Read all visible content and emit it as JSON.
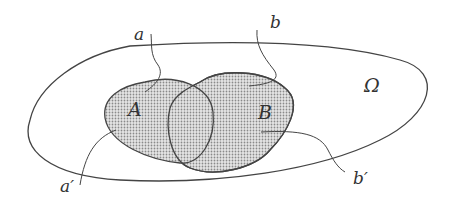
{
  "diagram": {
    "type": "venn-sets-with-paths",
    "universe_label": "Ω",
    "set_a_label": "A",
    "set_b_label": "B",
    "path_a_start": "a",
    "path_a_end": "a′",
    "path_b_start": "b",
    "path_b_end": "b′",
    "colors": {
      "stroke": "#444444",
      "fill_dots": "#9a9a9a",
      "background": "#ffffff"
    }
  }
}
